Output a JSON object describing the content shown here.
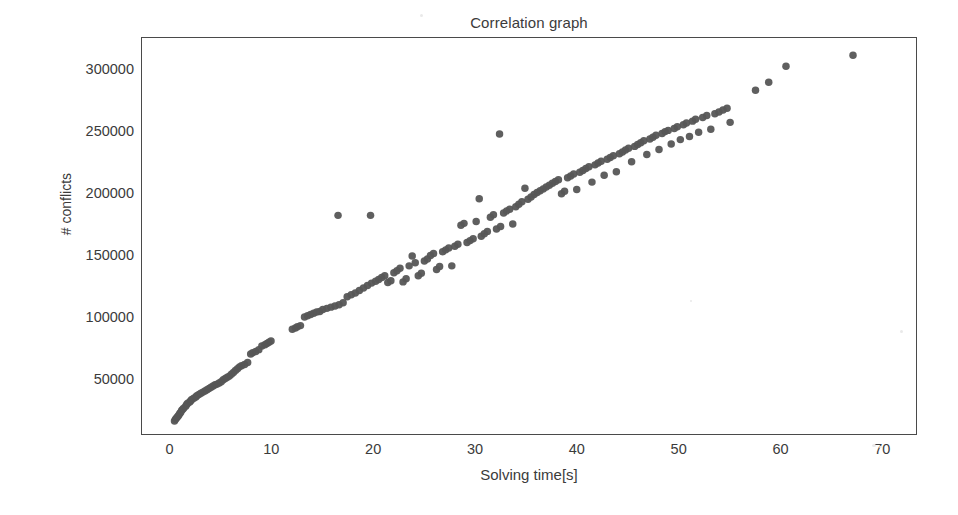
{
  "chart_data": {
    "type": "scatter",
    "title": "Correlation graph",
    "xlabel": "Solving time[s]",
    "ylabel": "# conflicts",
    "xlim": [
      -2.8,
      73.4
    ],
    "ylim": [
      5500,
      327000
    ],
    "xticks": [
      0,
      10,
      20,
      30,
      40,
      50,
      60,
      70
    ],
    "xtick_labels": [
      "0",
      "10",
      "20",
      "30",
      "40",
      "50",
      "60",
      "70"
    ],
    "yticks": [
      50000,
      100000,
      150000,
      200000,
      250000,
      300000
    ],
    "ytick_labels": [
      "50000",
      "100000",
      "150000",
      "200000",
      "250000",
      "300000"
    ],
    "grid": false,
    "legend": null,
    "marker": {
      "shape": "circle",
      "color": "#565656",
      "size": 7.5,
      "opacity": 0.95
    },
    "background_color": "#ffffff",
    "frame_color": "#4a4a4a",
    "series": [
      {
        "name": "instances",
        "points": [
          [
            0.4,
            16000
          ],
          [
            0.5,
            17500
          ],
          [
            0.6,
            18500
          ],
          [
            0.7,
            19500
          ],
          [
            0.8,
            20500
          ],
          [
            0.9,
            22000
          ],
          [
            1.0,
            23000
          ],
          [
            1.1,
            24500
          ],
          [
            1.2,
            25500
          ],
          [
            1.3,
            26500
          ],
          [
            1.5,
            28000
          ],
          [
            1.6,
            29500
          ],
          [
            1.7,
            30500
          ],
          [
            1.9,
            31500
          ],
          [
            2.0,
            32500
          ],
          [
            2.1,
            33500
          ],
          [
            2.3,
            34500
          ],
          [
            2.5,
            35500
          ],
          [
            2.6,
            36500
          ],
          [
            2.8,
            37500
          ],
          [
            3.0,
            38500
          ],
          [
            3.2,
            39500
          ],
          [
            3.4,
            40500
          ],
          [
            3.6,
            41500
          ],
          [
            3.8,
            42500
          ],
          [
            4.0,
            43500
          ],
          [
            4.2,
            44500
          ],
          [
            4.4,
            45500
          ],
          [
            4.6,
            46000
          ],
          [
            4.8,
            47000
          ],
          [
            5.0,
            48000
          ],
          [
            5.2,
            49500
          ],
          [
            5.4,
            50500
          ],
          [
            5.6,
            51500
          ],
          [
            5.8,
            52500
          ],
          [
            6.0,
            54000
          ],
          [
            6.2,
            55500
          ],
          [
            6.4,
            57000
          ],
          [
            6.6,
            58500
          ],
          [
            6.8,
            60000
          ],
          [
            7.0,
            61000
          ],
          [
            7.3,
            62000
          ],
          [
            7.6,
            63500
          ],
          [
            7.9,
            70500
          ],
          [
            8.1,
            71500
          ],
          [
            8.4,
            72500
          ],
          [
            8.7,
            74000
          ],
          [
            9.0,
            77000
          ],
          [
            9.3,
            78000
          ],
          [
            9.5,
            79000
          ],
          [
            9.7,
            80000
          ],
          [
            9.9,
            81000
          ],
          [
            12.0,
            90500
          ],
          [
            12.3,
            91500
          ],
          [
            12.5,
            92500
          ],
          [
            12.8,
            93500
          ],
          [
            13.2,
            100500
          ],
          [
            13.5,
            101500
          ],
          [
            13.8,
            102500
          ],
          [
            14.1,
            103500
          ],
          [
            14.4,
            104500
          ],
          [
            14.7,
            105000
          ],
          [
            15.0,
            106500
          ],
          [
            15.4,
            107500
          ],
          [
            15.8,
            108500
          ],
          [
            16.2,
            109500
          ],
          [
            16.5,
            183000
          ],
          [
            16.6,
            110500
          ],
          [
            17.0,
            112000
          ],
          [
            17.4,
            117000
          ],
          [
            17.8,
            118500
          ],
          [
            18.2,
            120000
          ],
          [
            18.6,
            122000
          ],
          [
            19.0,
            124000
          ],
          [
            19.4,
            126000
          ],
          [
            19.7,
            183000
          ],
          [
            19.8,
            128000
          ],
          [
            20.2,
            129500
          ],
          [
            20.5,
            131000
          ],
          [
            20.8,
            132500
          ],
          [
            21.1,
            134000
          ],
          [
            21.4,
            128500
          ],
          [
            21.7,
            130000
          ],
          [
            22.0,
            136500
          ],
          [
            22.3,
            138000
          ],
          [
            22.6,
            140000
          ],
          [
            22.9,
            129000
          ],
          [
            23.2,
            131500
          ],
          [
            23.5,
            142000
          ],
          [
            23.8,
            150000
          ],
          [
            24.1,
            144500
          ],
          [
            24.4,
            134000
          ],
          [
            24.7,
            136000
          ],
          [
            25.0,
            146000
          ],
          [
            25.3,
            147500
          ],
          [
            25.6,
            150500
          ],
          [
            25.9,
            152000
          ],
          [
            26.2,
            139000
          ],
          [
            26.5,
            141500
          ],
          [
            26.8,
            153500
          ],
          [
            27.1,
            155000
          ],
          [
            27.4,
            156500
          ],
          [
            27.7,
            142000
          ],
          [
            28.0,
            158000
          ],
          [
            28.3,
            159500
          ],
          [
            28.6,
            175000
          ],
          [
            28.9,
            176500
          ],
          [
            29.2,
            161000
          ],
          [
            29.5,
            162500
          ],
          [
            29.8,
            164000
          ],
          [
            30.1,
            178000
          ],
          [
            30.4,
            196500
          ],
          [
            30.6,
            166000
          ],
          [
            30.9,
            168000
          ],
          [
            31.2,
            170000
          ],
          [
            31.5,
            181500
          ],
          [
            31.8,
            183500
          ],
          [
            32.1,
            172000
          ],
          [
            32.4,
            249000
          ],
          [
            32.5,
            174000
          ],
          [
            32.8,
            185000
          ],
          [
            33.1,
            186500
          ],
          [
            33.4,
            188000
          ],
          [
            33.7,
            176000
          ],
          [
            34.0,
            190000
          ],
          [
            34.3,
            192000
          ],
          [
            34.6,
            194000
          ],
          [
            34.9,
            205000
          ],
          [
            35.2,
            196000
          ],
          [
            35.5,
            198000
          ],
          [
            35.8,
            200000
          ],
          [
            36.1,
            201500
          ],
          [
            36.4,
            203000
          ],
          [
            36.7,
            204500
          ],
          [
            37.0,
            206000
          ],
          [
            37.3,
            207500
          ],
          [
            37.6,
            209000
          ],
          [
            37.9,
            210500
          ],
          [
            38.2,
            212000
          ],
          [
            38.5,
            200500
          ],
          [
            38.8,
            202500
          ],
          [
            39.1,
            213500
          ],
          [
            39.4,
            215000
          ],
          [
            39.7,
            216500
          ],
          [
            40.0,
            204000
          ],
          [
            40.3,
            218000
          ],
          [
            40.6,
            219500
          ],
          [
            40.9,
            221000
          ],
          [
            41.2,
            222500
          ],
          [
            41.5,
            210000
          ],
          [
            41.8,
            224000
          ],
          [
            42.1,
            225500
          ],
          [
            42.4,
            227000
          ],
          [
            42.7,
            215500
          ],
          [
            43.0,
            228500
          ],
          [
            43.3,
            230000
          ],
          [
            43.6,
            231500
          ],
          [
            43.9,
            218500
          ],
          [
            44.2,
            233000
          ],
          [
            44.5,
            234500
          ],
          [
            44.8,
            236000
          ],
          [
            45.1,
            237500
          ],
          [
            45.4,
            226500
          ],
          [
            45.7,
            239000
          ],
          [
            46.0,
            240500
          ],
          [
            46.3,
            242000
          ],
          [
            46.6,
            243500
          ],
          [
            46.9,
            232500
          ],
          [
            47.2,
            245000
          ],
          [
            47.5,
            246500
          ],
          [
            47.8,
            248000
          ],
          [
            48.1,
            236500
          ],
          [
            48.4,
            249500
          ],
          [
            48.7,
            251000
          ],
          [
            49.0,
            252000
          ],
          [
            49.3,
            241000
          ],
          [
            49.6,
            253500
          ],
          [
            49.9,
            255000
          ],
          [
            50.2,
            244500
          ],
          [
            50.5,
            256500
          ],
          [
            50.8,
            258000
          ],
          [
            51.1,
            247000
          ],
          [
            51.4,
            259500
          ],
          [
            51.7,
            261000
          ],
          [
            52.0,
            250500
          ],
          [
            52.4,
            262500
          ],
          [
            52.8,
            264000
          ],
          [
            53.2,
            253000
          ],
          [
            53.6,
            265500
          ],
          [
            54.0,
            267000
          ],
          [
            54.4,
            268500
          ],
          [
            54.8,
            270000
          ],
          [
            55.1,
            258500
          ],
          [
            57.6,
            284500
          ],
          [
            58.9,
            291000
          ],
          [
            60.6,
            304000
          ],
          [
            67.2,
            313000
          ]
        ]
      }
    ]
  },
  "axes": {
    "title": "Correlation graph",
    "x_axis_label": "Solving time[s]",
    "y_axis_label": "# conflicts"
  }
}
